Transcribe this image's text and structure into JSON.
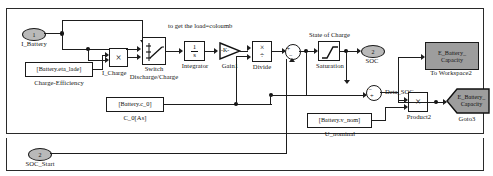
{
  "diagram": {
    "annotations": [
      {
        "name": "load-comment",
        "text": "to get the load=coloumb"
      },
      {
        "name": "state-of-charge-comment",
        "text": "State of Charge"
      },
      {
        "name": "delta-soc-signal-label",
        "text": "Deta_SOC"
      },
      {
        "name": "i-charge-signal-label",
        "text": "I_Charge"
      }
    ],
    "ports": {
      "inports": [
        {
          "name": "i-battery",
          "number": "1",
          "label": "I_Battery"
        },
        {
          "name": "soc-start",
          "number": "2",
          "label": "SOC_Start"
        }
      ],
      "outports": [
        {
          "name": "soc",
          "number": "2",
          "label": "SOC"
        }
      ]
    },
    "blocks": [
      {
        "name": "charge-efficiency",
        "text": "[Battery.eta_lade]",
        "caption": "Charge-Efficiency"
      },
      {
        "name": "i-charge-product",
        "text": "×",
        "caption": "I_Charge"
      },
      {
        "name": "switch",
        "text": "",
        "caption": "Switch",
        "caption2": "Discharge/Charge"
      },
      {
        "name": "integrator",
        "numerator": "1",
        "denominator": "s",
        "caption": "Integrator"
      },
      {
        "name": "gain1",
        "text": "-K-",
        "caption": "Gain1"
      },
      {
        "name": "divide",
        "op1": "×",
        "op2": "÷",
        "caption": "Divide"
      },
      {
        "name": "sum-soc",
        "plus": "+",
        "minus": "−",
        "caption": ""
      },
      {
        "name": "saturation",
        "text": "",
        "caption": "Saturation"
      },
      {
        "name": "c0-constant",
        "text": "[Battery.c_0]",
        "caption": "C_0[As]"
      },
      {
        "name": "delta-soc-sum",
        "plus": "+",
        "minus": "−",
        "caption": ""
      },
      {
        "name": "u-nominal-constant",
        "text": "[Battery.v_nom]",
        "caption": "U_nominal"
      },
      {
        "name": "product2",
        "text": "×",
        "caption": "Product2"
      },
      {
        "name": "to-workspace2",
        "text": "E_Battery_\nCapacity",
        "line1": "E_Battery_",
        "line2": "Capacity",
        "caption": "To Workspace2"
      },
      {
        "name": "goto3",
        "line1": "E_Battery_",
        "line2": "Capacity",
        "caption": "Goto3"
      }
    ]
  }
}
